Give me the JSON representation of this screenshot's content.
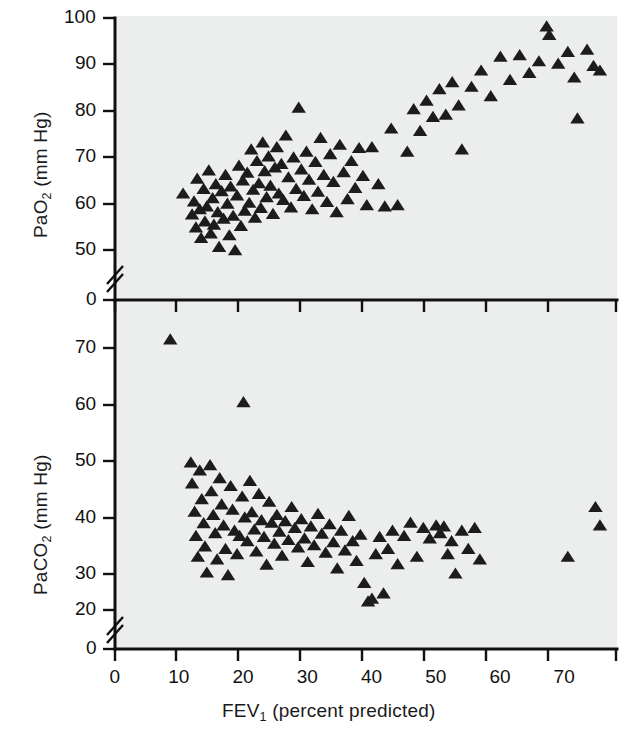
{
  "figure": {
    "background": "#ffffff",
    "panel_background": "#eceded",
    "marker_color": "#1c1c1c",
    "axis_color": "#101010"
  },
  "chart_data": [
    {
      "type": "scatter",
      "panel": "upper",
      "title": "",
      "xlabel": "FEV1 (percent predicted)",
      "ylabel": "PaO2 (mm Hg)",
      "xlim": [
        0,
        78
      ],
      "ylim": [
        0,
        100
      ],
      "y_break": true,
      "y_break_between": [
        0,
        50
      ],
      "grid": false,
      "legend": null,
      "xticks": [
        0,
        10,
        20,
        30,
        40,
        50,
        60,
        70
      ],
      "xticklabels": [
        "0",
        "10",
        "20",
        "30",
        "40",
        "50",
        "60",
        "70"
      ],
      "yticks": [
        0,
        50,
        60,
        70,
        80,
        90,
        100
      ],
      "yticklabels": [
        "0",
        "50",
        "60",
        "70",
        "80",
        "90",
        "100"
      ],
      "marker": "triangle-up",
      "points": [
        [
          10.6,
          62.0
        ],
        [
          12.0,
          57.5
        ],
        [
          12.3,
          60.3
        ],
        [
          12.6,
          54.7
        ],
        [
          12.8,
          65.2
        ],
        [
          13.2,
          58.6
        ],
        [
          13.4,
          52.4
        ],
        [
          13.8,
          63.0
        ],
        [
          14.0,
          56.0
        ],
        [
          14.3,
          59.2
        ],
        [
          14.6,
          67.0
        ],
        [
          14.9,
          53.4
        ],
        [
          15.2,
          61.0
        ],
        [
          15.4,
          55.3
        ],
        [
          15.7,
          64.0
        ],
        [
          16.0,
          58.0
        ],
        [
          16.2,
          50.5
        ],
        [
          16.6,
          62.5
        ],
        [
          16.9,
          56.6
        ],
        [
          17.2,
          66.0
        ],
        [
          17.5,
          59.8
        ],
        [
          17.8,
          53.0
        ],
        [
          18.0,
          63.5
        ],
        [
          18.4,
          57.2
        ],
        [
          18.7,
          49.8
        ],
        [
          19.0,
          61.6
        ],
        [
          19.3,
          68.0
        ],
        [
          19.6,
          55.0
        ],
        [
          19.9,
          64.8
        ],
        [
          20.2,
          58.3
        ],
        [
          20.6,
          66.5
        ],
        [
          20.9,
          60.0
        ],
        [
          21.2,
          71.5
        ],
        [
          21.5,
          62.8
        ],
        [
          21.8,
          56.8
        ],
        [
          22.1,
          69.0
        ],
        [
          22.4,
          64.2
        ],
        [
          22.7,
          58.9
        ],
        [
          23.0,
          73.0
        ],
        [
          23.3,
          66.8
        ],
        [
          23.6,
          61.2
        ],
        [
          23.9,
          70.0
        ],
        [
          24.2,
          63.7
        ],
        [
          24.6,
          57.6
        ],
        [
          24.9,
          67.6
        ],
        [
          25.2,
          72.0
        ],
        [
          25.5,
          62.0
        ],
        [
          25.9,
          68.4
        ],
        [
          26.2,
          60.6
        ],
        [
          26.6,
          74.5
        ],
        [
          27.0,
          65.5
        ],
        [
          27.4,
          59.0
        ],
        [
          27.8,
          69.8
        ],
        [
          28.2,
          63.0
        ],
        [
          28.6,
          80.5
        ],
        [
          29.0,
          67.2
        ],
        [
          29.4,
          61.5
        ],
        [
          29.8,
          71.0
        ],
        [
          30.2,
          65.0
        ],
        [
          30.7,
          58.6
        ],
        [
          31.2,
          68.8
        ],
        [
          31.6,
          62.4
        ],
        [
          32.0,
          74.0
        ],
        [
          32.5,
          66.0
        ],
        [
          33.0,
          60.2
        ],
        [
          33.5,
          70.5
        ],
        [
          34.0,
          64.5
        ],
        [
          34.5,
          58.0
        ],
        [
          35.0,
          72.5
        ],
        [
          35.6,
          66.6
        ],
        [
          36.2,
          60.8
        ],
        [
          36.8,
          69.0
        ],
        [
          37.4,
          63.2
        ],
        [
          38.0,
          71.8
        ],
        [
          38.6,
          65.8
        ],
        [
          39.2,
          59.5
        ],
        [
          40.0,
          72.0
        ],
        [
          41.0,
          64.0
        ],
        [
          42.0,
          59.2
        ],
        [
          43.0,
          76.0
        ],
        [
          44.0,
          59.5
        ],
        [
          45.5,
          71.0
        ],
        [
          46.5,
          80.2
        ],
        [
          47.5,
          75.5
        ],
        [
          48.5,
          82.0
        ],
        [
          49.5,
          78.5
        ],
        [
          50.5,
          84.5
        ],
        [
          51.5,
          79.0
        ],
        [
          52.5,
          86.0
        ],
        [
          53.5,
          81.0
        ],
        [
          54.0,
          71.5
        ],
        [
          55.5,
          85.0
        ],
        [
          57.0,
          88.5
        ],
        [
          58.5,
          83.0
        ],
        [
          60.0,
          91.5
        ],
        [
          61.5,
          86.5
        ],
        [
          63.0,
          91.8
        ],
        [
          64.5,
          88.0
        ],
        [
          66.0,
          90.5
        ],
        [
          67.2,
          98.0
        ],
        [
          67.6,
          96.2
        ],
        [
          69.0,
          90.0
        ],
        [
          70.5,
          92.5
        ],
        [
          71.5,
          87.0
        ],
        [
          72.0,
          78.2
        ],
        [
          73.5,
          93.0
        ],
        [
          74.5,
          89.5
        ],
        [
          75.5,
          88.5
        ]
      ]
    },
    {
      "type": "scatter",
      "panel": "lower",
      "title": "",
      "xlabel": "FEV1 (percent predicted)",
      "ylabel": "PaCO2 (mm Hg)",
      "xlim": [
        0,
        78
      ],
      "ylim": [
        0,
        75
      ],
      "y_break": true,
      "y_break_between": [
        0,
        20
      ],
      "grid": false,
      "legend": null,
      "xticks": [
        0,
        10,
        20,
        30,
        40,
        50,
        60,
        70
      ],
      "xticklabels": [
        "0",
        "10",
        "20",
        "30",
        "40",
        "50",
        "60",
        "70"
      ],
      "yticks": [
        0,
        20,
        30,
        40,
        50,
        60,
        70
      ],
      "yticklabels": [
        "0",
        "20",
        "30",
        "40",
        "50",
        "60",
        "70"
      ],
      "marker": "triangle-up",
      "points": [
        [
          8.6,
          71.5
        ],
        [
          20.0,
          59.5
        ],
        [
          11.8,
          48.0
        ],
        [
          12.0,
          44.0
        ],
        [
          12.4,
          38.6
        ],
        [
          12.6,
          34.0
        ],
        [
          12.9,
          30.0
        ],
        [
          13.2,
          46.5
        ],
        [
          13.5,
          41.0
        ],
        [
          13.8,
          36.4
        ],
        [
          14.0,
          32.0
        ],
        [
          14.3,
          27.0
        ],
        [
          14.8,
          47.5
        ],
        [
          15.0,
          42.5
        ],
        [
          15.3,
          38.0
        ],
        [
          15.6,
          34.5
        ],
        [
          15.9,
          29.5
        ],
        [
          16.3,
          45.0
        ],
        [
          16.6,
          40.0
        ],
        [
          16.9,
          36.0
        ],
        [
          17.2,
          31.5
        ],
        [
          17.6,
          26.5
        ],
        [
          18.0,
          43.5
        ],
        [
          18.3,
          39.0
        ],
        [
          18.6,
          35.0
        ],
        [
          19.0,
          30.5
        ],
        [
          19.4,
          34.0
        ],
        [
          19.8,
          41.5
        ],
        [
          20.2,
          37.5
        ],
        [
          20.6,
          33.0
        ],
        [
          21.0,
          44.5
        ],
        [
          21.3,
          38.5
        ],
        [
          21.7,
          35.2
        ],
        [
          22.0,
          31.0
        ],
        [
          22.4,
          42.0
        ],
        [
          22.8,
          37.0
        ],
        [
          23.2,
          33.8
        ],
        [
          23.6,
          28.5
        ],
        [
          24.0,
          40.5
        ],
        [
          24.4,
          36.5
        ],
        [
          24.8,
          32.5
        ],
        [
          25.2,
          38.0
        ],
        [
          25.6,
          34.8
        ],
        [
          26.0,
          30.2
        ],
        [
          26.5,
          36.8
        ],
        [
          27.0,
          33.2
        ],
        [
          27.5,
          39.5
        ],
        [
          28.0,
          35.5
        ],
        [
          28.5,
          31.8
        ],
        [
          29.0,
          37.2
        ],
        [
          29.5,
          33.5
        ],
        [
          30.0,
          29.0
        ],
        [
          30.5,
          35.8
        ],
        [
          31.0,
          32.2
        ],
        [
          31.6,
          38.2
        ],
        [
          32.2,
          34.4
        ],
        [
          32.8,
          30.8
        ],
        [
          33.4,
          36.2
        ],
        [
          34.0,
          32.8
        ],
        [
          34.6,
          27.8
        ],
        [
          35.2,
          35.0
        ],
        [
          35.8,
          31.2
        ],
        [
          36.4,
          37.8
        ],
        [
          37.0,
          33.0
        ],
        [
          37.6,
          29.2
        ],
        [
          38.2,
          34.2
        ],
        [
          38.8,
          25.0
        ],
        [
          39.4,
          21.5
        ],
        [
          40.0,
          22.0
        ],
        [
          40.6,
          30.5
        ],
        [
          41.2,
          33.8
        ],
        [
          41.8,
          23.0
        ],
        [
          42.5,
          31.5
        ],
        [
          43.2,
          35.0
        ],
        [
          44.0,
          28.6
        ],
        [
          45.0,
          34.0
        ],
        [
          46.0,
          36.5
        ],
        [
          47.0,
          30.0
        ],
        [
          48.0,
          35.5
        ],
        [
          49.0,
          33.5
        ],
        [
          50.0,
          36.0
        ],
        [
          50.6,
          34.5
        ],
        [
          51.2,
          35.8
        ],
        [
          51.8,
          30.5
        ],
        [
          52.4,
          33.0
        ],
        [
          53.0,
          26.8
        ],
        [
          54.0,
          35.0
        ],
        [
          55.0,
          31.5
        ],
        [
          56.0,
          35.5
        ],
        [
          56.8,
          29.5
        ],
        [
          70.5,
          30.0
        ],
        [
          74.8,
          39.5
        ],
        [
          75.5,
          36.0
        ]
      ]
    }
  ]
}
